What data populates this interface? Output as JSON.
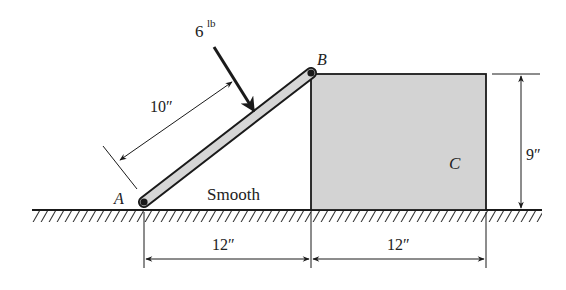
{
  "figure": {
    "type": "statics-free-body-problem",
    "colors": {
      "ink": "#1a1a1a",
      "rod_fill": "#d6d6d6",
      "block_fill": "#d3d3d3",
      "background": "#ffffff"
    },
    "labels": {
      "point_a": "A",
      "point_b": "B",
      "block": "C",
      "surface": "Smooth",
      "force_value": "6",
      "force_unit": "lb"
    },
    "dimensions": {
      "force_distance": "10″",
      "horizontal_rod": "12″",
      "block_width": "12″",
      "block_height": "9″"
    }
  }
}
